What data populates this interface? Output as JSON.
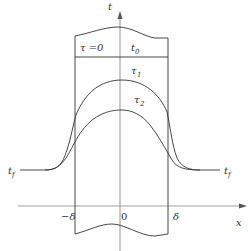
{
  "diagram": {
    "type": "temperature-profile",
    "colors": {
      "line": "#333333",
      "axis": "#777777",
      "background": "#ffffff"
    },
    "axes": {
      "vertical": {
        "label": "t"
      },
      "horizontal": {
        "label": "x"
      }
    },
    "labels": {
      "initial_time": "τ =0",
      "initial_temp": "t",
      "initial_temp_sub": "0",
      "curve1": "τ",
      "curve1_sub": "1",
      "curve2": "τ",
      "curve2_sub": "2",
      "fluid_left": "t",
      "fluid_left_sub": "f",
      "fluid_right": "t",
      "fluid_right_sub": "f",
      "neg_delta": "−δ",
      "origin": "0",
      "pos_delta": "δ"
    }
  }
}
